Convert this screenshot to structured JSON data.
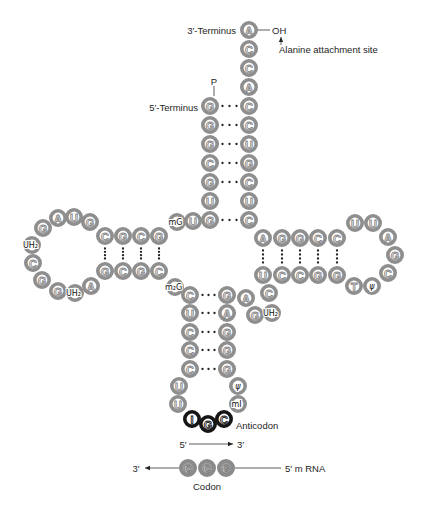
{
  "colors": {
    "ring": "#8e8e8e",
    "ring_letter": "#8a8a8a",
    "anticodon_ring": "#151515",
    "codon_fill": "#9c9c9c",
    "pair_dot": "#222222"
  },
  "labels": [
    {
      "name": "three-prime-terminus-label",
      "text": "3′-Terminus",
      "x": 236,
      "y": 30,
      "anchor": "end"
    },
    {
      "name": "oh-group-label",
      "text": "OH",
      "x": 272,
      "y": 30,
      "anchor": "start"
    },
    {
      "name": "alanine-attachment-label",
      "text": "Alanine attachment site",
      "x": 279,
      "y": 49,
      "anchor": "start"
    },
    {
      "name": "phosphate-label",
      "text": "P",
      "x": 214,
      "y": 81,
      "anchor": "middle"
    },
    {
      "name": "five-prime-terminus-label",
      "text": "5′-Terminus",
      "x": 198,
      "y": 107,
      "anchor": "end"
    },
    {
      "name": "anticodon-label",
      "text": "Anticodon",
      "x": 236,
      "y": 425,
      "anchor": "start"
    },
    {
      "name": "direction-5prime-label",
      "text": "5′",
      "x": 183,
      "y": 444,
      "anchor": "middle"
    },
    {
      "name": "direction-3prime-label",
      "text": "3′",
      "x": 237,
      "y": 444,
      "anchor": "start"
    },
    {
      "name": "mrna-3prime-label",
      "text": "3′",
      "x": 136,
      "y": 468,
      "anchor": "middle"
    },
    {
      "name": "mrna-5prime-label",
      "text": "5′ m RNA",
      "x": 285,
      "y": 468,
      "anchor": "start"
    },
    {
      "name": "codon-label",
      "text": "Codon",
      "x": 207,
      "y": 486,
      "anchor": "middle"
    }
  ],
  "nucleotides": [
    {
      "region": "acceptor-stem-3prime",
      "base": "A",
      "x": 249,
      "y": 30,
      "kind": "normal"
    },
    {
      "region": "acceptor-stem-3prime",
      "base": "C",
      "x": 249,
      "y": 49,
      "kind": "normal"
    },
    {
      "region": "acceptor-stem-3prime",
      "base": "C",
      "x": 249,
      "y": 68,
      "kind": "normal"
    },
    {
      "region": "acceptor-stem-3prime",
      "base": "A",
      "x": 249,
      "y": 87,
      "kind": "normal"
    },
    {
      "region": "acceptor-stem-3prime",
      "base": "C",
      "x": 249,
      "y": 106,
      "kind": "normal"
    },
    {
      "region": "acceptor-stem-3prime",
      "base": "C",
      "x": 249,
      "y": 125,
      "kind": "normal"
    },
    {
      "region": "acceptor-stem-3prime",
      "base": "U",
      "x": 249,
      "y": 144,
      "kind": "normal"
    },
    {
      "region": "acceptor-stem-3prime",
      "base": "G",
      "x": 249,
      "y": 163,
      "kind": "normal"
    },
    {
      "region": "acceptor-stem-3prime",
      "base": "C",
      "x": 249,
      "y": 182,
      "kind": "normal"
    },
    {
      "region": "acceptor-stem-3prime",
      "base": "U",
      "x": 249,
      "y": 201,
      "kind": "normal"
    },
    {
      "region": "acceptor-stem-3prime",
      "base": "C",
      "x": 249,
      "y": 220,
      "kind": "normal"
    },
    {
      "region": "acceptor-stem-5prime",
      "base": "G",
      "x": 210,
      "y": 106,
      "kind": "normal"
    },
    {
      "region": "acceptor-stem-5prime",
      "base": "G",
      "x": 210,
      "y": 125,
      "kind": "normal"
    },
    {
      "region": "acceptor-stem-5prime",
      "base": "G",
      "x": 210,
      "y": 144,
      "kind": "normal"
    },
    {
      "region": "acceptor-stem-5prime",
      "base": "C",
      "x": 210,
      "y": 163,
      "kind": "normal"
    },
    {
      "region": "acceptor-stem-5prime",
      "base": "G",
      "x": 210,
      "y": 182,
      "kind": "normal"
    },
    {
      "region": "acceptor-stem-5prime",
      "base": "U",
      "x": 210,
      "y": 201,
      "kind": "normal"
    },
    {
      "region": "acceptor-stem-5prime",
      "base": "G",
      "x": 210,
      "y": 220,
      "kind": "normal"
    },
    {
      "region": "d-arm-connector",
      "base": "U",
      "x": 193,
      "y": 221,
      "kind": "normal"
    },
    {
      "region": "d-arm-connector",
      "base": "G",
      "x": 177,
      "y": 222,
      "kind": "modified",
      "label": "mG"
    },
    {
      "region": "d-stem-top",
      "base": "G",
      "x": 159,
      "y": 236,
      "kind": "normal"
    },
    {
      "region": "d-stem-top",
      "base": "C",
      "x": 141,
      "y": 236,
      "kind": "normal"
    },
    {
      "region": "d-stem-top",
      "base": "G",
      "x": 123,
      "y": 236,
      "kind": "normal"
    },
    {
      "region": "d-stem-top",
      "base": "C",
      "x": 105,
      "y": 236,
      "kind": "normal"
    },
    {
      "region": "d-loop",
      "base": "G",
      "x": 90,
      "y": 222,
      "kind": "normal"
    },
    {
      "region": "d-loop",
      "base": "U",
      "x": 74,
      "y": 217,
      "kind": "normal"
    },
    {
      "region": "d-loop",
      "base": "A",
      "x": 58,
      "y": 218,
      "kind": "normal"
    },
    {
      "region": "d-loop",
      "base": "G",
      "x": 43,
      "y": 228,
      "kind": "normal"
    },
    {
      "region": "d-loop",
      "base": "U",
      "x": 32,
      "y": 245,
      "kind": "modified",
      "label": "UH₂"
    },
    {
      "region": "d-loop",
      "base": "C",
      "x": 33,
      "y": 263,
      "kind": "normal"
    },
    {
      "region": "d-loop",
      "base": "G",
      "x": 42,
      "y": 280,
      "kind": "normal"
    },
    {
      "region": "d-loop",
      "base": "G",
      "x": 58,
      "y": 291,
      "kind": "normal"
    },
    {
      "region": "d-loop",
      "base": "U",
      "x": 75,
      "y": 293,
      "kind": "modified",
      "label": "UH₂"
    },
    {
      "region": "d-loop",
      "base": "A",
      "x": 91,
      "y": 286,
      "kind": "normal"
    },
    {
      "region": "d-stem-bottom",
      "base": "G",
      "x": 105,
      "y": 271,
      "kind": "normal"
    },
    {
      "region": "d-stem-bottom",
      "base": "C",
      "x": 123,
      "y": 271,
      "kind": "normal"
    },
    {
      "region": "d-stem-bottom",
      "base": "G",
      "x": 141,
      "y": 271,
      "kind": "normal"
    },
    {
      "region": "d-stem-bottom",
      "base": "C",
      "x": 159,
      "y": 271,
      "kind": "normal"
    },
    {
      "region": "d-anticodon-connector",
      "base": "G",
      "x": 175,
      "y": 287,
      "kind": "modified",
      "label": "m₂G"
    },
    {
      "region": "anticodon-stem-5prime",
      "base": "C",
      "x": 190,
      "y": 295,
      "kind": "normal"
    },
    {
      "region": "anticodon-stem-5prime",
      "base": "U",
      "x": 190,
      "y": 313,
      "kind": "normal"
    },
    {
      "region": "anticodon-stem-5prime",
      "base": "C",
      "x": 190,
      "y": 332,
      "kind": "normal"
    },
    {
      "region": "anticodon-stem-5prime",
      "base": "C",
      "x": 190,
      "y": 350,
      "kind": "normal"
    },
    {
      "region": "anticodon-stem-5prime",
      "base": "C",
      "x": 190,
      "y": 369,
      "kind": "normal"
    },
    {
      "region": "anticodon-loop",
      "base": "U",
      "x": 179,
      "y": 386,
      "kind": "normal"
    },
    {
      "region": "anticodon-loop",
      "base": "U",
      "x": 178,
      "y": 404,
      "kind": "normal"
    },
    {
      "region": "anticodon-loop",
      "base": "I",
      "x": 192,
      "y": 419,
      "kind": "anticodon"
    },
    {
      "region": "anticodon-loop",
      "base": "G",
      "x": 208,
      "y": 424,
      "kind": "anticodon"
    },
    {
      "region": "anticodon-loop",
      "base": "C",
      "x": 224,
      "y": 419,
      "kind": "anticodon"
    },
    {
      "region": "anticodon-loop",
      "base": "I",
      "x": 238,
      "y": 404,
      "kind": "modified",
      "label": "mI"
    },
    {
      "region": "anticodon-loop",
      "base": "ψ",
      "x": 238,
      "y": 386,
      "kind": "modified",
      "label": "ψ"
    },
    {
      "region": "anticodon-stem-3prime",
      "base": "G",
      "x": 227,
      "y": 369,
      "kind": "normal"
    },
    {
      "region": "anticodon-stem-3prime",
      "base": "G",
      "x": 227,
      "y": 350,
      "kind": "normal"
    },
    {
      "region": "anticodon-stem-3prime",
      "base": "G",
      "x": 227,
      "y": 332,
      "kind": "normal"
    },
    {
      "region": "anticodon-stem-3prime",
      "base": "A",
      "x": 227,
      "y": 313,
      "kind": "normal"
    },
    {
      "region": "anticodon-stem-3prime",
      "base": "G",
      "x": 227,
      "y": 295,
      "kind": "normal"
    },
    {
      "region": "variable-loop",
      "base": "A",
      "x": 246,
      "y": 298,
      "kind": "normal"
    },
    {
      "region": "variable-loop",
      "base": "G",
      "x": 255,
      "y": 315,
      "kind": "normal"
    },
    {
      "region": "variable-loop",
      "base": "U",
      "x": 272,
      "y": 313,
      "kind": "modified",
      "label": "UH₂"
    },
    {
      "region": "variable-loop",
      "base": "C",
      "x": 269,
      "y": 293,
      "kind": "normal"
    },
    {
      "region": "t-stem-5prime",
      "base": "U",
      "x": 263,
      "y": 275,
      "kind": "normal"
    },
    {
      "region": "t-stem-5prime",
      "base": "C",
      "x": 282,
      "y": 275,
      "kind": "normal"
    },
    {
      "region": "t-stem-5prime",
      "base": "C",
      "x": 300,
      "y": 275,
      "kind": "normal"
    },
    {
      "region": "t-stem-5prime",
      "base": "G",
      "x": 318,
      "y": 275,
      "kind": "normal"
    },
    {
      "region": "t-stem-5prime",
      "base": "G",
      "x": 337,
      "y": 275,
      "kind": "normal"
    },
    {
      "region": "t-loop",
      "base": "T",
      "x": 354,
      "y": 286,
      "kind": "normal"
    },
    {
      "region": "t-loop",
      "base": "ψ",
      "x": 372,
      "y": 286,
      "kind": "modified",
      "label": "ψ"
    },
    {
      "region": "t-loop",
      "base": "C",
      "x": 388,
      "y": 273,
      "kind": "normal"
    },
    {
      "region": "t-loop",
      "base": "G",
      "x": 395,
      "y": 255,
      "kind": "normal"
    },
    {
      "region": "t-loop",
      "base": "A",
      "x": 388,
      "y": 237,
      "kind": "normal"
    },
    {
      "region": "t-loop",
      "base": "U",
      "x": 373,
      "y": 223,
      "kind": "normal"
    },
    {
      "region": "t-loop",
      "base": "U",
      "x": 355,
      "y": 223,
      "kind": "normal"
    },
    {
      "region": "t-stem-3prime",
      "base": "C",
      "x": 337,
      "y": 238,
      "kind": "normal"
    },
    {
      "region": "t-stem-3prime",
      "base": "C",
      "x": 318,
      "y": 238,
      "kind": "normal"
    },
    {
      "region": "t-stem-3prime",
      "base": "G",
      "x": 300,
      "y": 238,
      "kind": "normal"
    },
    {
      "region": "t-stem-3prime",
      "base": "G",
      "x": 282,
      "y": 238,
      "kind": "normal"
    },
    {
      "region": "t-stem-3prime",
      "base": "A",
      "x": 263,
      "y": 238,
      "kind": "normal"
    },
    {
      "region": "mrna-codon",
      "base": "C",
      "x": 188,
      "y": 468,
      "kind": "codon"
    },
    {
      "region": "mrna-codon",
      "base": "C",
      "x": 207,
      "y": 468,
      "kind": "codon"
    },
    {
      "region": "mrna-codon",
      "base": "G",
      "x": 226,
      "y": 468,
      "kind": "codon"
    }
  ],
  "pairs": [
    {
      "stem": "acceptor",
      "a": [
        210,
        106
      ],
      "b": [
        249,
        106
      ]
    },
    {
      "stem": "acceptor",
      "a": [
        210,
        125
      ],
      "b": [
        249,
        125
      ]
    },
    {
      "stem": "acceptor",
      "a": [
        210,
        144
      ],
      "b": [
        249,
        144
      ]
    },
    {
      "stem": "acceptor",
      "a": [
        210,
        163
      ],
      "b": [
        249,
        163
      ]
    },
    {
      "stem": "acceptor",
      "a": [
        210,
        182
      ],
      "b": [
        249,
        182
      ]
    },
    {
      "stem": "acceptor",
      "a": [
        210,
        220
      ],
      "b": [
        249,
        220
      ]
    },
    {
      "stem": "d",
      "a": [
        105,
        236
      ],
      "b": [
        105,
        271
      ]
    },
    {
      "stem": "d",
      "a": [
        123,
        236
      ],
      "b": [
        123,
        271
      ]
    },
    {
      "stem": "d",
      "a": [
        141,
        236
      ],
      "b": [
        141,
        271
      ]
    },
    {
      "stem": "d",
      "a": [
        159,
        236
      ],
      "b": [
        159,
        271
      ]
    },
    {
      "stem": "anticodon",
      "a": [
        190,
        295
      ],
      "b": [
        227,
        295
      ]
    },
    {
      "stem": "anticodon",
      "a": [
        190,
        313
      ],
      "b": [
        227,
        313
      ]
    },
    {
      "stem": "anticodon",
      "a": [
        190,
        332
      ],
      "b": [
        227,
        332
      ]
    },
    {
      "stem": "anticodon",
      "a": [
        190,
        350
      ],
      "b": [
        227,
        350
      ]
    },
    {
      "stem": "anticodon",
      "a": [
        190,
        369
      ],
      "b": [
        227,
        369
      ]
    },
    {
      "stem": "t",
      "a": [
        263,
        238
      ],
      "b": [
        263,
        275
      ]
    },
    {
      "stem": "t",
      "a": [
        282,
        238
      ],
      "b": [
        282,
        275
      ]
    },
    {
      "stem": "t",
      "a": [
        300,
        238
      ],
      "b": [
        300,
        275
      ]
    },
    {
      "stem": "t",
      "a": [
        318,
        238
      ],
      "b": [
        318,
        275
      ]
    },
    {
      "stem": "t",
      "a": [
        337,
        238
      ],
      "b": [
        337,
        275
      ]
    }
  ]
}
